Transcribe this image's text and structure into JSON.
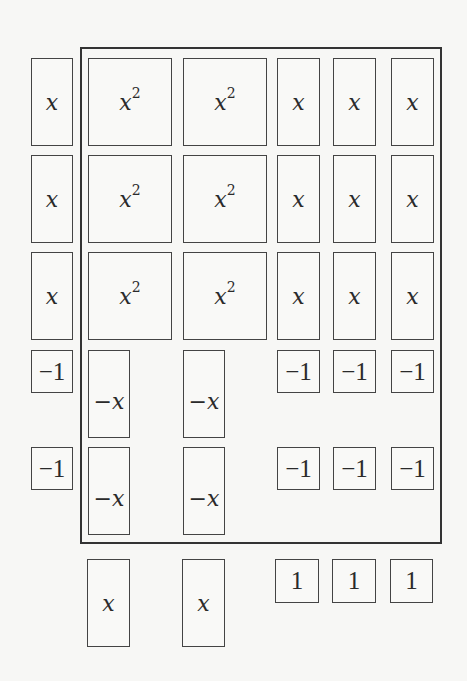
{
  "diagram": {
    "type": "algebra-tiles",
    "frame": {
      "left": 80,
      "top": 47,
      "width": 362,
      "height": 497
    },
    "left_factor": [
      {
        "label": "x",
        "kind": "x",
        "x": 31,
        "y": 58,
        "w": 42,
        "h": 88
      },
      {
        "label": "x",
        "kind": "x",
        "x": 31,
        "y": 155,
        "w": 42,
        "h": 88
      },
      {
        "label": "x",
        "kind": "x",
        "x": 31,
        "y": 252,
        "w": 42,
        "h": 88
      },
      {
        "label": "−1",
        "kind": "unit",
        "x": 31,
        "y": 350,
        "w": 42,
        "h": 43
      },
      {
        "label": "−1",
        "kind": "unit",
        "x": 31,
        "y": 447,
        "w": 42,
        "h": 43
      }
    ],
    "product_tiles": [
      {
        "label": "x",
        "sup": "2",
        "kind": "x2",
        "x": 88,
        "y": 58,
        "w": 84,
        "h": 88
      },
      {
        "label": "x",
        "sup": "2",
        "kind": "x2",
        "x": 183,
        "y": 58,
        "w": 84,
        "h": 88
      },
      {
        "label": "x",
        "kind": "x",
        "x": 277,
        "y": 58,
        "w": 43,
        "h": 88
      },
      {
        "label": "x",
        "kind": "x",
        "x": 333,
        "y": 58,
        "w": 43,
        "h": 88
      },
      {
        "label": "x",
        "kind": "x",
        "x": 391,
        "y": 58,
        "w": 43,
        "h": 88
      },
      {
        "label": "x",
        "sup": "2",
        "kind": "x2",
        "x": 88,
        "y": 155,
        "w": 84,
        "h": 88
      },
      {
        "label": "x",
        "sup": "2",
        "kind": "x2",
        "x": 183,
        "y": 155,
        "w": 84,
        "h": 88
      },
      {
        "label": "x",
        "kind": "x",
        "x": 277,
        "y": 155,
        "w": 43,
        "h": 88
      },
      {
        "label": "x",
        "kind": "x",
        "x": 333,
        "y": 155,
        "w": 43,
        "h": 88
      },
      {
        "label": "x",
        "kind": "x",
        "x": 391,
        "y": 155,
        "w": 43,
        "h": 88
      },
      {
        "label": "x",
        "sup": "2",
        "kind": "x2",
        "x": 88,
        "y": 252,
        "w": 84,
        "h": 88
      },
      {
        "label": "x",
        "sup": "2",
        "kind": "x2",
        "x": 183,
        "y": 252,
        "w": 84,
        "h": 88
      },
      {
        "label": "x",
        "kind": "x",
        "x": 277,
        "y": 252,
        "w": 43,
        "h": 88
      },
      {
        "label": "x",
        "kind": "x",
        "x": 333,
        "y": 252,
        "w": 43,
        "h": 88
      },
      {
        "label": "x",
        "kind": "x",
        "x": 391,
        "y": 252,
        "w": 43,
        "h": 88
      },
      {
        "label": "−x",
        "kind": "negx",
        "x": 88,
        "y": 350,
        "w": 42,
        "h": 88
      },
      {
        "label": "−x",
        "kind": "negx",
        "x": 183,
        "y": 350,
        "w": 42,
        "h": 88
      },
      {
        "label": "−1",
        "kind": "unit",
        "x": 277,
        "y": 350,
        "w": 43,
        "h": 43
      },
      {
        "label": "−1",
        "kind": "unit",
        "x": 333,
        "y": 350,
        "w": 43,
        "h": 43
      },
      {
        "label": "−1",
        "kind": "unit",
        "x": 391,
        "y": 350,
        "w": 43,
        "h": 43
      },
      {
        "label": "−x",
        "kind": "negx",
        "x": 88,
        "y": 447,
        "w": 42,
        "h": 88
      },
      {
        "label": "−x",
        "kind": "negx",
        "x": 183,
        "y": 447,
        "w": 42,
        "h": 88
      },
      {
        "label": "−1",
        "kind": "unit",
        "x": 277,
        "y": 447,
        "w": 43,
        "h": 43
      },
      {
        "label": "−1",
        "kind": "unit",
        "x": 333,
        "y": 447,
        "w": 43,
        "h": 43
      },
      {
        "label": "−1",
        "kind": "unit",
        "x": 391,
        "y": 447,
        "w": 43,
        "h": 43
      }
    ],
    "bottom_factor": [
      {
        "label": "x",
        "kind": "x",
        "x": 87,
        "y": 559,
        "w": 43,
        "h": 88
      },
      {
        "label": "x",
        "kind": "x",
        "x": 182,
        "y": 559,
        "w": 43,
        "h": 88
      },
      {
        "label": "1",
        "kind": "unit",
        "x": 275,
        "y": 559,
        "w": 44,
        "h": 44
      },
      {
        "label": "1",
        "kind": "unit",
        "x": 332,
        "y": 559,
        "w": 44,
        "h": 44
      },
      {
        "label": "1",
        "kind": "unit",
        "x": 390,
        "y": 559,
        "w": 43,
        "h": 44
      }
    ]
  }
}
